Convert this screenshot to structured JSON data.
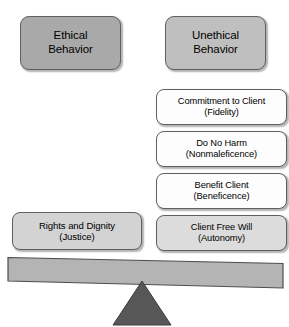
{
  "diagram": {
    "headers": [
      {
        "id": "ethical",
        "label": "Ethical\nBehavior",
        "fill": "#a9a9a9"
      },
      {
        "id": "unethical",
        "label": "Unethical\nBehavior",
        "fill": "#bfbfbf"
      }
    ],
    "left_pan": {
      "items": [
        {
          "id": "justice",
          "label": "Rights and Dignity\n(Justice)",
          "fill": "#d3d3d3"
        }
      ]
    },
    "right_pan": {
      "items": [
        {
          "id": "fidelity",
          "label": "Commitment to Client\n(Fidelity)",
          "fill": "#fdfdfd"
        },
        {
          "id": "nonmaleficence",
          "label": "Do No Harm\n(Nonmaleficence)",
          "fill": "#fdfdfd"
        },
        {
          "id": "beneficence",
          "label": "Benefit Client\n(Beneficence)",
          "fill": "#fdfdfd"
        },
        {
          "id": "autonomy",
          "label": "Client Free Will\n(Autonomy)",
          "fill": "#dcdcdc"
        }
      ]
    },
    "seesaw": {
      "beam_fill": "#b4b4b4",
      "beam_stroke": "#4d4d4d",
      "fulcrum_fill": "#575757",
      "fulcrum_stroke": "#3d3d3d",
      "tilt": "right-side-down"
    },
    "colors": {
      "outline": "#606060",
      "text": "#000000",
      "background": "#ffffff"
    }
  }
}
